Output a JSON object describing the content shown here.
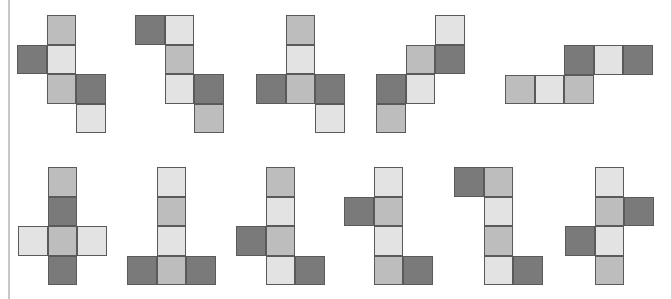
{
  "diagram": {
    "cell_size": 29.5,
    "colors": {
      "dark": "#7a7a7a",
      "mid": "#bdbdbd",
      "light": "#e3e3e3",
      "border": "#5a5a5a",
      "rule": "#c8c8c8"
    },
    "nets": [
      {
        "id": "net-1",
        "x": 17,
        "y": 15,
        "cells": [
          [
            1,
            0,
            "m"
          ],
          [
            0,
            1,
            "d"
          ],
          [
            1,
            1,
            "l"
          ],
          [
            1,
            2,
            "m"
          ],
          [
            2,
            2,
            "d"
          ],
          [
            2,
            3,
            "l"
          ]
        ]
      },
      {
        "id": "net-2",
        "x": 135,
        "y": 15,
        "cells": [
          [
            0,
            0,
            "d"
          ],
          [
            1,
            0,
            "l"
          ],
          [
            1,
            1,
            "m"
          ],
          [
            1,
            2,
            "l"
          ],
          [
            2,
            2,
            "d"
          ],
          [
            2,
            3,
            "m"
          ]
        ]
      },
      {
        "id": "net-3",
        "x": 256,
        "y": 15,
        "cells": [
          [
            1,
            0,
            "m"
          ],
          [
            1,
            1,
            "l"
          ],
          [
            0,
            2,
            "d"
          ],
          [
            1,
            2,
            "m"
          ],
          [
            2,
            2,
            "d"
          ],
          [
            2,
            3,
            "l"
          ]
        ]
      },
      {
        "id": "net-4",
        "x": 376,
        "y": 15,
        "cells": [
          [
            2,
            0,
            "l"
          ],
          [
            1,
            1,
            "m"
          ],
          [
            2,
            1,
            "d"
          ],
          [
            0,
            2,
            "d"
          ],
          [
            1,
            2,
            "l"
          ],
          [
            0,
            3,
            "m"
          ]
        ]
      },
      {
        "id": "net-5",
        "x": 505,
        "y": 45,
        "cells": [
          [
            2,
            0,
            "d"
          ],
          [
            3,
            0,
            "l"
          ],
          [
            4,
            0,
            "d"
          ],
          [
            0,
            1,
            "m"
          ],
          [
            1,
            1,
            "l"
          ],
          [
            2,
            1,
            "m"
          ]
        ]
      },
      {
        "id": "net-6",
        "x": 18,
        "y": 167,
        "cells": [
          [
            1,
            0,
            "m"
          ],
          [
            1,
            1,
            "d"
          ],
          [
            0,
            2,
            "l"
          ],
          [
            1,
            2,
            "m"
          ],
          [
            2,
            2,
            "l"
          ],
          [
            1,
            3,
            "d"
          ]
        ]
      },
      {
        "id": "net-7",
        "x": 127,
        "y": 167,
        "cells": [
          [
            1,
            0,
            "l"
          ],
          [
            1,
            1,
            "m"
          ],
          [
            1,
            2,
            "l"
          ],
          [
            0,
            3,
            "d"
          ],
          [
            1,
            3,
            "m"
          ],
          [
            2,
            3,
            "d"
          ]
        ]
      },
      {
        "id": "net-8",
        "x": 236,
        "y": 167,
        "cells": [
          [
            1,
            0,
            "m"
          ],
          [
            1,
            1,
            "l"
          ],
          [
            0,
            2,
            "d"
          ],
          [
            1,
            2,
            "m"
          ],
          [
            1,
            3,
            "l"
          ],
          [
            2,
            3,
            "d"
          ]
        ]
      },
      {
        "id": "net-9",
        "x": 344,
        "y": 167,
        "cells": [
          [
            1,
            0,
            "l"
          ],
          [
            0,
            1,
            "d"
          ],
          [
            1,
            1,
            "m"
          ],
          [
            1,
            2,
            "l"
          ],
          [
            1,
            3,
            "m"
          ],
          [
            2,
            3,
            "d"
          ]
        ]
      },
      {
        "id": "net-10",
        "x": 454,
        "y": 167,
        "cells": [
          [
            0,
            0,
            "d"
          ],
          [
            1,
            0,
            "m"
          ],
          [
            1,
            1,
            "l"
          ],
          [
            1,
            2,
            "m"
          ],
          [
            1,
            3,
            "l"
          ],
          [
            2,
            3,
            "d"
          ]
        ]
      },
      {
        "id": "net-11",
        "x": 565,
        "y": 167,
        "cells": [
          [
            1,
            0,
            "l"
          ],
          [
            1,
            1,
            "m"
          ],
          [
            2,
            1,
            "d"
          ],
          [
            0,
            2,
            "d"
          ],
          [
            1,
            2,
            "l"
          ],
          [
            1,
            3,
            "m"
          ]
        ]
      }
    ]
  }
}
